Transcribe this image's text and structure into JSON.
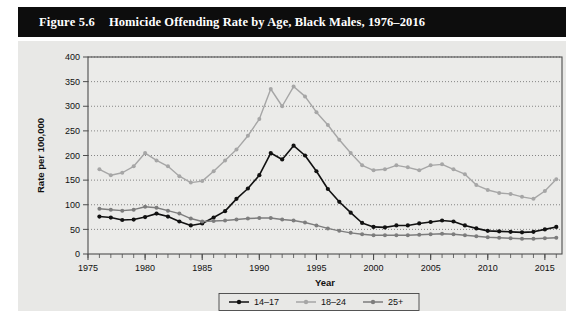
{
  "figure": {
    "number_label": "Figure 5.6",
    "title": "Homicide Offending Rate by Age, Black Males, 1976–2016"
  },
  "colors": {
    "title_bar_bg": "#0d0d0d",
    "title_text": "#ffffff",
    "panel_bg": "#e8e8e6",
    "plot_bg": "#ebebe9",
    "axis": "#4d4d4d",
    "grid": "#6b6b6b",
    "series_14_17": "#111111",
    "series_18_24": "#a6a6a6",
    "series_25plus": "#7d7d7d"
  },
  "chart_data": {
    "type": "line",
    "title": "Homicide Offending Rate by Age, Black Males, 1976–2016",
    "xlabel": "Year",
    "ylabel": "Rate per 100,000",
    "xlim": [
      1975,
      2016.5
    ],
    "ylim": [
      0,
      400
    ],
    "yticks": [
      0,
      50,
      100,
      150,
      200,
      250,
      300,
      350,
      400
    ],
    "ytick_labels": [
      "0",
      "50",
      "100",
      "150",
      "200",
      "250",
      "300",
      "350",
      "400"
    ],
    "xticks": [
      1975,
      1980,
      1985,
      1990,
      1995,
      2000,
      2005,
      2010,
      2015
    ],
    "xtick_labels": [
      "1975",
      "1980",
      "1985",
      "1990",
      "1995",
      "2000",
      "2005",
      "2010",
      "2015"
    ],
    "x_minor_tick_step": 1,
    "grid": "horizontal-dotted",
    "legend_position": "below-axis-centered",
    "markers": "filled-circle",
    "x": [
      1976,
      1977,
      1978,
      1979,
      1980,
      1981,
      1982,
      1983,
      1984,
      1985,
      1986,
      1987,
      1988,
      1989,
      1990,
      1991,
      1992,
      1993,
      1994,
      1995,
      1996,
      1997,
      1998,
      1999,
      2000,
      2001,
      2002,
      2003,
      2004,
      2005,
      2006,
      2007,
      2008,
      2009,
      2010,
      2011,
      2012,
      2013,
      2014,
      2015,
      2016
    ],
    "series": [
      {
        "name": "14–17",
        "color": "#111111",
        "values": [
          76,
          74,
          69,
          70,
          75,
          82,
          76,
          66,
          58,
          62,
          74,
          87,
          112,
          133,
          160,
          205,
          192,
          220,
          200,
          168,
          132,
          106,
          84,
          63,
          55,
          54,
          58,
          58,
          62,
          65,
          68,
          66,
          58,
          52,
          47,
          46,
          45,
          44,
          45,
          50,
          55
        ]
      },
      {
        "name": "18–24",
        "color": "#a6a6a6",
        "values": [
          172,
          160,
          165,
          178,
          205,
          190,
          178,
          158,
          145,
          148,
          168,
          190,
          212,
          240,
          274,
          335,
          300,
          340,
          320,
          288,
          262,
          232,
          205,
          180,
          170,
          172,
          180,
          176,
          170,
          180,
          182,
          172,
          162,
          140,
          130,
          124,
          122,
          116,
          112,
          128,
          152
        ]
      },
      {
        "name": "25+",
        "color": "#7d7d7d",
        "values": [
          92,
          90,
          88,
          90,
          96,
          94,
          88,
          82,
          72,
          66,
          67,
          68,
          70,
          72,
          73,
          73,
          70,
          68,
          64,
          58,
          52,
          47,
          43,
          40,
          38,
          38,
          38,
          38,
          39,
          40,
          41,
          40,
          38,
          36,
          34,
          33,
          32,
          31,
          31,
          32,
          33
        ]
      }
    ]
  },
  "legend": {
    "items": [
      {
        "label": "14–17",
        "color": "#111111"
      },
      {
        "label": "18–24",
        "color": "#a6a6a6"
      },
      {
        "label": "25+",
        "color": "#7d7d7d"
      }
    ]
  }
}
